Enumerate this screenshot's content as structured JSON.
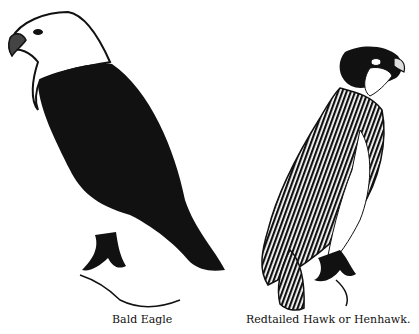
{
  "figures": [
    {
      "id": "eagle",
      "caption": "Bald Eagle"
    },
    {
      "id": "hawk",
      "caption": "Redtailed Hawk or Henhawk."
    }
  ],
  "colors": {
    "ink": "#111111",
    "paper": "#ffffff"
  }
}
